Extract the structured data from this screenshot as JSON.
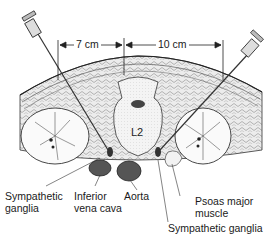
{
  "figure": {
    "vertebra_label": "L2",
    "measurements": [
      {
        "id": "left",
        "label": "7 cm"
      },
      {
        "id": "right",
        "label": "10 cm"
      }
    ],
    "labels": [
      {
        "id": "sympathetic-ganglia-left",
        "line1": "Sympathetic",
        "line2": "ganglia"
      },
      {
        "id": "inferior-vena-cava",
        "line1": "Inferior",
        "line2": "vena cava"
      },
      {
        "id": "aorta",
        "line1": "Aorta",
        "line2": ""
      },
      {
        "id": "psoas-major",
        "line1": "Psoas major",
        "line2": "muscle"
      },
      {
        "id": "sympathetic-ganglia-right",
        "line1": "Sympathetic ganglia",
        "line2": ""
      }
    ],
    "colors": {
      "ink": "#1a1a1a",
      "vessel_fill": "#555555",
      "tissue_fill": "#e8e8e8",
      "bone_fill": "#f2f2f2"
    }
  }
}
